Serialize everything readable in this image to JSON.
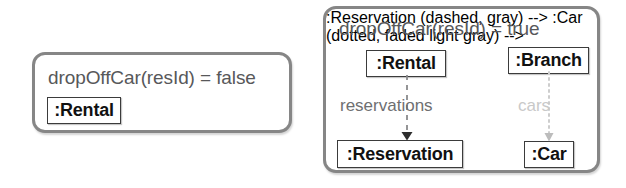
{
  "diagram": {
    "type": "uml-object-diagram-pair",
    "panels": [
      {
        "id": "false-case",
        "title": "dropOffCar(resId) = false",
        "objects": [
          {
            "id": "rental",
            "label": ":Rental"
          }
        ],
        "links": []
      },
      {
        "id": "true-case",
        "title": "dropOffCar(resId) = true",
        "objects": [
          {
            "id": "rental",
            "label": ":Rental"
          },
          {
            "id": "branch",
            "label": ":Branch"
          },
          {
            "id": "reservation",
            "label": ":Reservation"
          },
          {
            "id": "car",
            "label": ":Car"
          }
        ],
        "links": [
          {
            "id": "reservations",
            "label": "reservations",
            "from": ":Rental",
            "to": ":Reservation",
            "style": "dashed",
            "color": "#8a8a8c"
          },
          {
            "id": "cars",
            "label": "cars",
            "from": ":Branch",
            "to": ":Car",
            "style": "dotted",
            "color": "#cdcdcd"
          }
        ]
      }
    ]
  },
  "colors": {
    "panel_border": "#868686",
    "panel_background": "#ffffff",
    "title_text": "#57585a",
    "object_border": "#3b3b3b",
    "object_text": "#111111",
    "link_active": "#8a8a8c",
    "link_faded": "#cdcdcd"
  }
}
